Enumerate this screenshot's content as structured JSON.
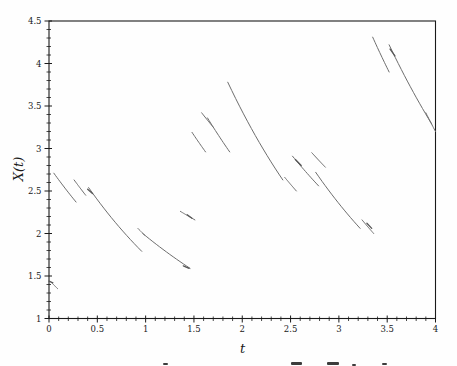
{
  "chart_data": {
    "type": "line",
    "title": "",
    "xlabel": "t",
    "ylabel": "X(t)",
    "xlim": [
      0,
      4
    ],
    "ylim": [
      1,
      4.5
    ],
    "x_tick_values": [
      0,
      0.5,
      1,
      1.5,
      2,
      2.5,
      3,
      3.5,
      4
    ],
    "x_tick_labels": [
      "0",
      "0.5",
      "1",
      "1.5",
      "2",
      "2.5",
      "3",
      "3.5",
      "4"
    ],
    "y_tick_values": [
      1,
      1.5,
      2,
      2.5,
      3,
      3.5,
      4,
      4.5
    ],
    "y_tick_labels": [
      "1",
      "1.5",
      "2",
      "2.5",
      "3",
      "3.5",
      "4",
      "4.5"
    ],
    "minor_tick_step": 0.1,
    "grid": false,
    "legend": null,
    "line_color": "#6e6e6e",
    "hook_color": "#575757",
    "axis_color": "#1a1a1a",
    "segments": [
      {
        "t1": 0.02,
        "x1": 1.43,
        "t2": 0.09,
        "x2": 1.35
      },
      {
        "t1": 0.05,
        "x1": 2.71,
        "t2": 0.28,
        "x2": 2.37
      },
      {
        "t1": 0.26,
        "x1": 2.63,
        "t2": 0.38,
        "x2": 2.45
      },
      {
        "t1": 0.41,
        "x1": 2.54,
        "t2": 0.96,
        "x2": 1.79
      },
      {
        "t1": 0.92,
        "x1": 2.06,
        "t2": 0.99,
        "x2": 1.98
      },
      {
        "t1": 0.97,
        "x1": 2.0,
        "t2": 1.46,
        "x2": 1.59
      },
      {
        "t1": 1.36,
        "x1": 2.26,
        "t2": 1.51,
        "x2": 2.16
      },
      {
        "t1": 1.48,
        "x1": 3.19,
        "t2": 1.62,
        "x2": 2.96
      },
      {
        "t1": 1.58,
        "x1": 3.42,
        "t2": 1.7,
        "x2": 3.25
      },
      {
        "t1": 1.64,
        "x1": 3.36,
        "t2": 1.87,
        "x2": 2.96
      },
      {
        "t1": 1.85,
        "x1": 3.78,
        "t2": 2.42,
        "x2": 2.63
      },
      {
        "t1": 2.44,
        "x1": 2.66,
        "t2": 2.56,
        "x2": 2.5
      },
      {
        "t1": 2.52,
        "x1": 2.91,
        "t2": 2.79,
        "x2": 2.56
      },
      {
        "t1": 2.72,
        "x1": 2.95,
        "t2": 2.86,
        "x2": 2.78
      },
      {
        "t1": 2.76,
        "x1": 2.72,
        "t2": 3.22,
        "x2": 2.06
      },
      {
        "t1": 3.24,
        "x1": 2.16,
        "t2": 3.36,
        "x2": 2.0
      },
      {
        "t1": 3.35,
        "x1": 4.31,
        "t2": 3.52,
        "x2": 3.9
      },
      {
        "t1": 3.52,
        "x1": 4.22,
        "t2": 3.96,
        "x2": 3.29
      },
      {
        "t1": 3.9,
        "x1": 3.42,
        "t2": 4.0,
        "x2": 3.2
      }
    ],
    "jump_hooks": [
      {
        "t1": 0.0,
        "x1": 1.44,
        "t2": 0.04,
        "x2": 1.42
      },
      {
        "t1": 0.4,
        "x1": 2.52,
        "t2": 0.45,
        "x2": 2.47
      },
      {
        "t1": 1.39,
        "x1": 1.62,
        "t2": 1.45,
        "x2": 1.59
      },
      {
        "t1": 1.43,
        "x1": 2.22,
        "t2": 1.48,
        "x2": 2.18
      },
      {
        "t1": 2.55,
        "x1": 2.87,
        "t2": 2.61,
        "x2": 2.8
      },
      {
        "t1": 3.29,
        "x1": 2.12,
        "t2": 3.34,
        "x2": 2.06
      },
      {
        "t1": 3.53,
        "x1": 4.17,
        "t2": 3.58,
        "x2": 4.09
      }
    ],
    "caption_fragments": [
      {
        "x": 163,
        "y": 363,
        "w": 5,
        "h": 2
      },
      {
        "x": 291,
        "y": 362,
        "w": 11,
        "h": 3
      },
      {
        "x": 327,
        "y": 362,
        "w": 12,
        "h": 3
      },
      {
        "x": 352,
        "y": 364,
        "w": 4,
        "h": 2
      },
      {
        "x": 382,
        "y": 363,
        "w": 5,
        "h": 2
      }
    ]
  }
}
